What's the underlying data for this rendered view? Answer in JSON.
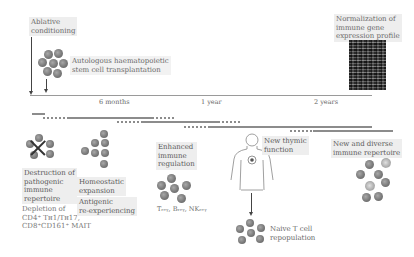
{
  "figure": {
    "timeline": {
      "ticks": [
        {
          "label": "6 months",
          "x": 99
        },
        {
          "label": "1 year",
          "x": 200
        },
        {
          "label": "2 years",
          "x": 314
        }
      ]
    },
    "events_top": {
      "ablative_conditioning": "Ablative conditioning",
      "ablative_line1": "Ablative",
      "ablative_line2": "conditioning",
      "ahsct_line1": "Autologous haematopoietic",
      "ahsct_line2": "stem cell transplantation",
      "normalization_line1": "Normalization of",
      "normalization_line2": "immune gene",
      "normalization_line3": "expression profile"
    },
    "stages": [
      {
        "id": "destruction",
        "title_lines": [
          "Destruction of",
          "pathogenic",
          "immune",
          "repertoire"
        ],
        "detail_lines": [
          "Depletion of",
          "CD4⁺ Tʜ1/Tʜ17,",
          "CD8⁺CD161⁺ MAIT"
        ]
      },
      {
        "id": "homeostatic",
        "title_lines": [
          "Homeostatic",
          "expansion"
        ],
        "sub_lines": [
          "Antigenic",
          "re-experiencing"
        ]
      },
      {
        "id": "regulation",
        "title_lines": [
          "Enhanced",
          "immune",
          "regulation"
        ],
        "cells_label": "Tᵣₑᵧ, Bᵣₑᵧ, NKᵣₑᵧ"
      },
      {
        "id": "thymic",
        "title_lines": [
          "New thymic",
          "function"
        ],
        "result_lines": [
          "Naive T cell",
          "repopulation"
        ]
      },
      {
        "id": "diverse",
        "title_lines": [
          "New and diverse",
          "immune repertoire"
        ]
      }
    ],
    "colors": {
      "label_bg": "#eeeeee",
      "cell": "#7a7a7a",
      "axis": "#9a9a9a",
      "bar": "#8c8c8c"
    }
  }
}
